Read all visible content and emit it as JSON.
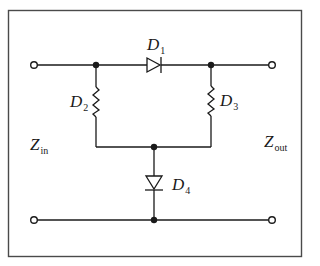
{
  "diagram": {
    "type": "circuit",
    "colors": {
      "stroke": "#1a1a1a",
      "frame": "#4a4a4a",
      "background": "#ffffff"
    },
    "labels": {
      "d1": {
        "main": "D",
        "sub": "1"
      },
      "d2": {
        "main": "D",
        "sub": "2"
      },
      "d3": {
        "main": "D",
        "sub": "3"
      },
      "d4": {
        "main": "D",
        "sub": "4"
      },
      "zin": {
        "main": "Z",
        "sub": "in"
      },
      "zout": {
        "main": "Z",
        "sub": "out"
      }
    },
    "components": [
      {
        "id": "D1",
        "kind": "diode",
        "orientation": "series-top, anode left, cathode right"
      },
      {
        "id": "D2",
        "kind": "resistor-like (varistor)",
        "orientation": "vertical, left branch"
      },
      {
        "id": "D3",
        "kind": "resistor-like (varistor)",
        "orientation": "vertical, right branch"
      },
      {
        "id": "D4",
        "kind": "diode",
        "orientation": "vertical shunt, cathode down"
      }
    ],
    "terminals": [
      "input-top",
      "input-bottom",
      "output-top",
      "output-bottom"
    ]
  }
}
